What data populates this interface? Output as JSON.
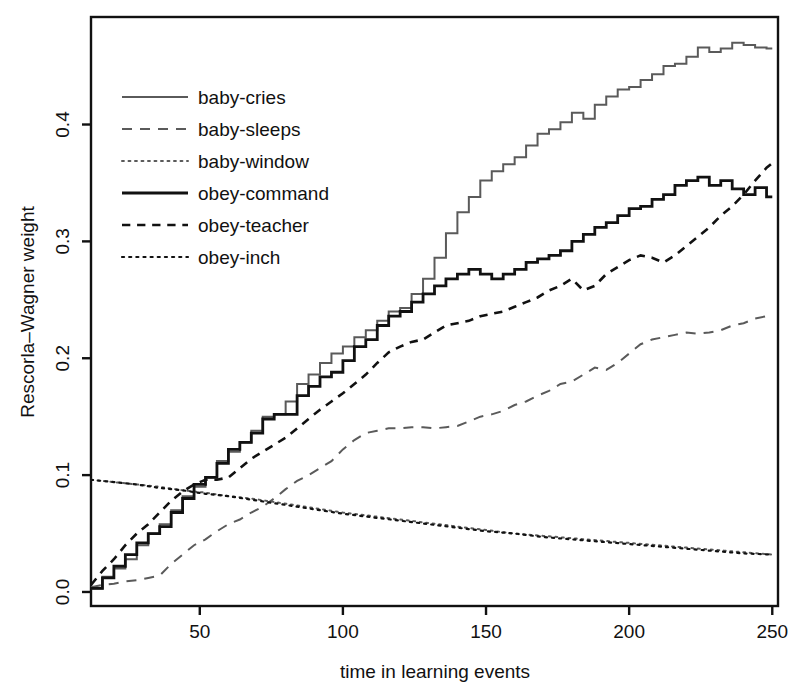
{
  "chart_data": {
    "type": "line",
    "title": "",
    "xlabel": "time in learning events",
    "ylabel": "Rescorla–Wagner weight",
    "xlim": [
      12,
      252
    ],
    "ylim": [
      -0.012,
      0.492
    ],
    "xticks": [
      50,
      100,
      150,
      200,
      250
    ],
    "xtick_labels": [
      "50",
      "100",
      "150",
      "200",
      "250"
    ],
    "yticks": [
      0.0,
      0.1,
      0.2,
      0.3,
      0.4
    ],
    "ytick_labels": [
      "0.0",
      "0.1",
      "0.2",
      "0.3",
      "0.4"
    ],
    "grid": false,
    "legend_position": "top-left",
    "frame": "box",
    "series": [
      {
        "name": "baby-cries",
        "style": "solid",
        "color": "#5a5a5a",
        "width": 2.0,
        "x": [
          12,
          16,
          20,
          24,
          28,
          32,
          36,
          40,
          44,
          48,
          52,
          56,
          60,
          64,
          68,
          72,
          76,
          80,
          84,
          88,
          92,
          96,
          100,
          104,
          108,
          112,
          116,
          120,
          124,
          128,
          132,
          136,
          140,
          144,
          148,
          152,
          156,
          160,
          164,
          168,
          172,
          176,
          180,
          184,
          188,
          192,
          196,
          200,
          204,
          208,
          212,
          216,
          220,
          224,
          228,
          232,
          236,
          240,
          244,
          248,
          250
        ],
        "values": [
          0.003,
          0.013,
          0.02,
          0.028,
          0.04,
          0.05,
          0.058,
          0.07,
          0.082,
          0.09,
          0.098,
          0.112,
          0.12,
          0.128,
          0.138,
          0.15,
          0.152,
          0.163,
          0.178,
          0.186,
          0.196,
          0.204,
          0.21,
          0.218,
          0.224,
          0.232,
          0.24,
          0.243,
          0.255,
          0.268,
          0.286,
          0.307,
          0.325,
          0.338,
          0.352,
          0.36,
          0.366,
          0.372,
          0.382,
          0.392,
          0.396,
          0.402,
          0.41,
          0.405,
          0.417,
          0.424,
          0.43,
          0.432,
          0.438,
          0.443,
          0.45,
          0.452,
          0.458,
          0.466,
          0.462,
          0.465,
          0.47,
          0.468,
          0.466,
          0.465,
          0.465
        ]
      },
      {
        "name": "baby-sleeps",
        "style": "dashed",
        "color": "#5a5a5a",
        "width": 2.0,
        "x": [
          12,
          16,
          20,
          24,
          28,
          32,
          36,
          40,
          44,
          48,
          52,
          56,
          60,
          64,
          68,
          72,
          76,
          80,
          84,
          88,
          92,
          96,
          100,
          104,
          108,
          112,
          116,
          120,
          124,
          128,
          132,
          136,
          140,
          144,
          148,
          152,
          156,
          160,
          164,
          168,
          172,
          176,
          180,
          184,
          188,
          192,
          196,
          200,
          204,
          208,
          212,
          216,
          220,
          224,
          228,
          232,
          236,
          240,
          244,
          248,
          250
        ],
        "values": [
          0.004,
          0.006,
          0.007,
          0.009,
          0.01,
          0.012,
          0.014,
          0.024,
          0.032,
          0.04,
          0.045,
          0.052,
          0.058,
          0.062,
          0.068,
          0.073,
          0.08,
          0.088,
          0.095,
          0.1,
          0.106,
          0.112,
          0.122,
          0.13,
          0.136,
          0.138,
          0.14,
          0.14,
          0.141,
          0.141,
          0.14,
          0.141,
          0.142,
          0.146,
          0.15,
          0.152,
          0.155,
          0.16,
          0.163,
          0.168,
          0.172,
          0.178,
          0.18,
          0.186,
          0.192,
          0.19,
          0.196,
          0.204,
          0.212,
          0.216,
          0.218,
          0.22,
          0.222,
          0.221,
          0.222,
          0.224,
          0.228,
          0.23,
          0.234,
          0.236,
          0.237
        ]
      },
      {
        "name": "baby-window",
        "style": "dotted",
        "color": "#5a5a5a",
        "width": 2.0,
        "x": [
          12,
          20,
          28,
          36,
          44,
          52,
          60,
          68,
          76,
          84,
          92,
          100,
          110,
          120,
          130,
          140,
          150,
          160,
          170,
          180,
          190,
          200,
          210,
          220,
          230,
          240,
          250
        ],
        "values": [
          0.096,
          0.094,
          0.092,
          0.09,
          0.087,
          0.085,
          0.082,
          0.08,
          0.077,
          0.074,
          0.071,
          0.068,
          0.065,
          0.062,
          0.059,
          0.056,
          0.053,
          0.05,
          0.048,
          0.046,
          0.044,
          0.042,
          0.04,
          0.038,
          0.036,
          0.034,
          0.032
        ]
      },
      {
        "name": "obey-command",
        "style": "solid",
        "color": "#111111",
        "width": 2.8,
        "x": [
          12,
          16,
          20,
          24,
          28,
          32,
          36,
          40,
          44,
          48,
          52,
          56,
          60,
          64,
          68,
          72,
          76,
          80,
          84,
          88,
          92,
          96,
          100,
          104,
          108,
          112,
          116,
          120,
          124,
          128,
          132,
          136,
          140,
          144,
          148,
          152,
          156,
          160,
          164,
          168,
          172,
          176,
          180,
          184,
          188,
          192,
          196,
          200,
          204,
          208,
          212,
          216,
          220,
          224,
          228,
          232,
          236,
          240,
          244,
          248,
          250
        ],
        "values": [
          0.003,
          0.012,
          0.022,
          0.032,
          0.042,
          0.05,
          0.056,
          0.068,
          0.08,
          0.092,
          0.098,
          0.11,
          0.122,
          0.128,
          0.136,
          0.148,
          0.152,
          0.152,
          0.168,
          0.176,
          0.184,
          0.188,
          0.198,
          0.21,
          0.216,
          0.228,
          0.236,
          0.24,
          0.248,
          0.255,
          0.262,
          0.268,
          0.272,
          0.276,
          0.272,
          0.268,
          0.272,
          0.276,
          0.282,
          0.285,
          0.288,
          0.292,
          0.3,
          0.306,
          0.312,
          0.316,
          0.322,
          0.328,
          0.33,
          0.336,
          0.34,
          0.348,
          0.352,
          0.355,
          0.348,
          0.352,
          0.345,
          0.34,
          0.346,
          0.338,
          0.338
        ]
      },
      {
        "name": "obey-teacher",
        "style": "dashed-short",
        "color": "#111111",
        "width": 2.6,
        "x": [
          12,
          16,
          20,
          24,
          28,
          32,
          36,
          40,
          44,
          48,
          52,
          56,
          60,
          64,
          68,
          72,
          76,
          80,
          84,
          88,
          92,
          96,
          100,
          104,
          108,
          112,
          116,
          120,
          124,
          128,
          132,
          136,
          140,
          144,
          148,
          152,
          156,
          160,
          164,
          168,
          172,
          176,
          180,
          184,
          188,
          192,
          196,
          200,
          204,
          208,
          212,
          216,
          220,
          224,
          228,
          232,
          236,
          240,
          244,
          248,
          250
        ],
        "values": [
          0.006,
          0.018,
          0.028,
          0.04,
          0.05,
          0.058,
          0.068,
          0.078,
          0.086,
          0.092,
          0.096,
          0.096,
          0.098,
          0.106,
          0.114,
          0.12,
          0.126,
          0.132,
          0.14,
          0.148,
          0.156,
          0.163,
          0.17,
          0.178,
          0.186,
          0.196,
          0.205,
          0.21,
          0.214,
          0.216,
          0.222,
          0.228,
          0.23,
          0.232,
          0.236,
          0.238,
          0.24,
          0.244,
          0.248,
          0.252,
          0.258,
          0.262,
          0.268,
          0.258,
          0.262,
          0.272,
          0.278,
          0.284,
          0.288,
          0.286,
          0.282,
          0.288,
          0.296,
          0.304,
          0.312,
          0.322,
          0.33,
          0.34,
          0.352,
          0.363,
          0.367
        ]
      },
      {
        "name": "obey-inch",
        "style": "dotted",
        "color": "#111111",
        "width": 2.2,
        "x": [
          12,
          20,
          28,
          36,
          44,
          52,
          60,
          68,
          76,
          84,
          92,
          100,
          110,
          120,
          130,
          140,
          150,
          160,
          170,
          180,
          190,
          200,
          210,
          220,
          230,
          240,
          250
        ],
        "values": [
          0.096,
          0.094,
          0.092,
          0.089,
          0.087,
          0.084,
          0.082,
          0.079,
          0.076,
          0.073,
          0.07,
          0.067,
          0.064,
          0.061,
          0.058,
          0.055,
          0.052,
          0.05,
          0.047,
          0.045,
          0.043,
          0.041,
          0.039,
          0.037,
          0.035,
          0.033,
          0.032
        ]
      }
    ]
  },
  "legend": {
    "items": [
      {
        "label": "baby-cries"
      },
      {
        "label": "baby-sleeps"
      },
      {
        "label": "baby-window"
      },
      {
        "label": "obey-command"
      },
      {
        "label": "obey-teacher"
      },
      {
        "label": "obey-inch"
      }
    ]
  }
}
